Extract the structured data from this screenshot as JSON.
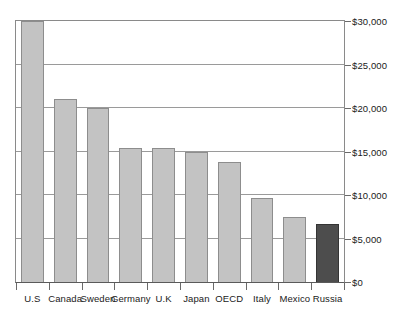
{
  "chart_data": {
    "type": "bar",
    "title": "",
    "subtitle": "",
    "xlabel": "",
    "ylabel": "",
    "categories": [
      "U.S",
      "Canada",
      "Sweden",
      "Germany",
      "U.K",
      "Japan",
      "OECD",
      "Italy",
      "Mexico",
      "Russia"
    ],
    "values": [
      30000,
      21000,
      20000,
      15400,
      15400,
      15000,
      13800,
      9600,
      7500,
      6700
    ],
    "value_labels": [
      "$30,000",
      "$21,000",
      "$20,000",
      "$15,400",
      "$15,400",
      "$15,000",
      "$13,800",
      "$9,600",
      "$7,500",
      "$6,700"
    ],
    "ylim": [
      0,
      30000
    ],
    "yticks": [
      0,
      5000,
      10000,
      15000,
      20000,
      25000,
      30000
    ],
    "ytick_labels": [
      "$0",
      "$5,000",
      "$10,000",
      "$15,000",
      "$20,000",
      "$25,000",
      "$30,000"
    ],
    "grid": true,
    "legend": null,
    "legend_position": "none",
    "series": [
      {
        "name": "",
        "values": [
          30000,
          21000,
          20000,
          15400,
          15400,
          15000,
          13800,
          9600,
          7500,
          6700
        ]
      }
    ],
    "bar_colors": [
      "#c3c3c3",
      "#c3c3c3",
      "#c3c3c3",
      "#c3c3c3",
      "#c3c3c3",
      "#c3c3c3",
      "#c3c3c3",
      "#c3c3c3",
      "#c3c3c3",
      "#4d4d4d"
    ],
    "highlight_category": "Russia",
    "highlight_color": "#4d4d4d",
    "default_bar_color": "#c3c3c3",
    "bar_border_color": "#8d8d8d",
    "axis_color": "#8a8a8a",
    "grid_color": "#9a9a9a",
    "background_color": "#ffffff",
    "text_color": "#1a1a1a"
  }
}
